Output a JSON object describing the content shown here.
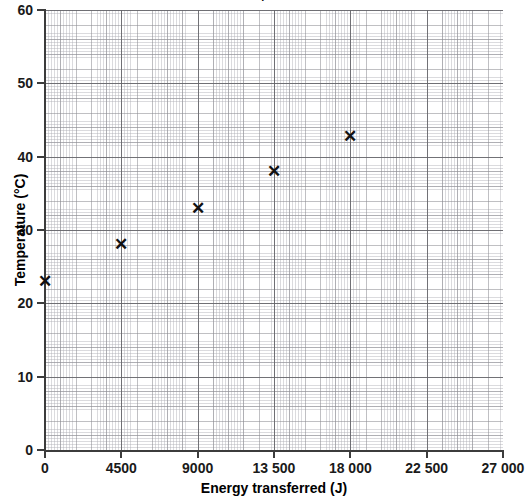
{
  "title_remnant": "·",
  "chart_data": {
    "type": "scatter",
    "title": "",
    "xlabel": "Energy transferred (J)",
    "ylabel": "Temperature (°C)",
    "xlim": [
      0,
      27000
    ],
    "ylim": [
      0,
      60
    ],
    "grid": true,
    "legend": "none",
    "x": [
      0,
      4500,
      9000,
      13500,
      18000
    ],
    "y": [
      23,
      28,
      33,
      38,
      42.8
    ],
    "points": [
      {
        "x": 0,
        "y": 23
      },
      {
        "x": 4500,
        "y": 28
      },
      {
        "x": 9000,
        "y": 33
      },
      {
        "x": 13500,
        "y": 38
      },
      {
        "x": 18000,
        "y": 42.8
      }
    ],
    "marker": "x",
    "marker_color": "#111111",
    "xticks": [
      0,
      4500,
      9000,
      13500,
      18000,
      22500,
      27000
    ],
    "xtick_labels": [
      "0",
      "4500",
      "9000",
      "13 500",
      "18 000",
      "22 500",
      "27 000"
    ],
    "yticks": [
      0,
      10,
      20,
      30,
      40,
      50,
      60
    ],
    "ytick_labels": [
      "0",
      "10",
      "20",
      "30",
      "40",
      "50",
      "60"
    ],
    "grid_color": "#8c8c92",
    "axis_color": "#3c3c3c",
    "background": "#ffffff"
  }
}
